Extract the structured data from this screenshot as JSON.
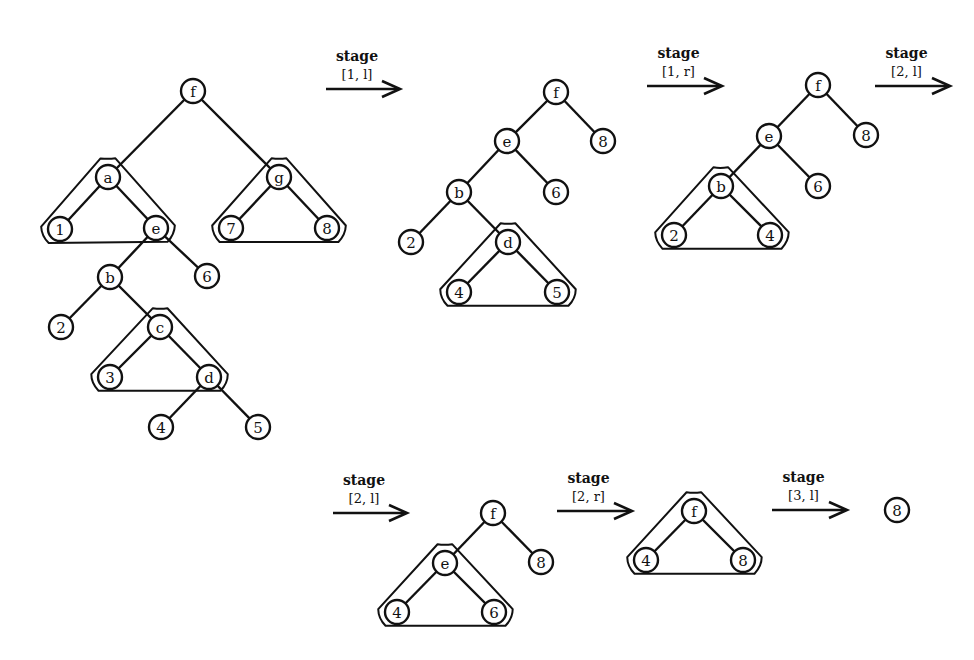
{
  "figure": {
    "node_radius": 12,
    "stroke_color": "#111111",
    "background": "#ffffff"
  },
  "arrows": [
    {
      "id": "a1",
      "word": "stage",
      "index": "[1, l]",
      "x1": 326,
      "x2": 400,
      "y": 89
    },
    {
      "id": "a2",
      "word": "stage",
      "index": "[1, r]",
      "x1": 647,
      "x2": 722,
      "y": 86
    },
    {
      "id": "a3",
      "word": "stage",
      "index": "[2, l]",
      "x1": 875,
      "x2": 950,
      "y": 86
    },
    {
      "id": "a4",
      "word": "stage",
      "index": "[2, l]",
      "x1": 333,
      "x2": 407,
      "y": 513
    },
    {
      "id": "a5",
      "word": "stage",
      "index": "[2, r]",
      "x1": 557,
      "x2": 632,
      "y": 511
    },
    {
      "id": "a6",
      "word": "stage",
      "index": "[3, l]",
      "x1": 772,
      "x2": 847,
      "y": 510
    }
  ],
  "trees": [
    {
      "id": "tree-0",
      "nodes": [
        {
          "label": "f",
          "x": 193,
          "y": 91
        },
        {
          "label": "a",
          "x": 108,
          "y": 177
        },
        {
          "label": "g",
          "x": 279,
          "y": 177
        },
        {
          "label": "1",
          "x": 60,
          "y": 229
        },
        {
          "label": "e",
          "x": 156,
          "y": 228
        },
        {
          "label": "7",
          "x": 231,
          "y": 228
        },
        {
          "label": "8",
          "x": 327,
          "y": 228
        },
        {
          "label": "b",
          "x": 110,
          "y": 277
        },
        {
          "label": "6",
          "x": 207,
          "y": 276
        },
        {
          "label": "2",
          "x": 61,
          "y": 327
        },
        {
          "label": "c",
          "x": 160,
          "y": 327
        },
        {
          "label": "3",
          "x": 110,
          "y": 377
        },
        {
          "label": "d",
          "x": 209,
          "y": 377
        },
        {
          "label": "4",
          "x": 161,
          "y": 427
        },
        {
          "label": "5",
          "x": 258,
          "y": 427
        }
      ],
      "edges": [
        [
          "f",
          "a"
        ],
        [
          "f",
          "g"
        ],
        [
          "a",
          "1"
        ],
        [
          "a",
          "e"
        ],
        [
          "g",
          "7"
        ],
        [
          "g",
          "8"
        ],
        [
          "e",
          "b"
        ],
        [
          "e",
          "6"
        ],
        [
          "b",
          "2"
        ],
        [
          "b",
          "c"
        ],
        [
          "c",
          "3"
        ],
        [
          "c",
          "d"
        ],
        [
          "d",
          "4"
        ],
        [
          "d",
          "5"
        ]
      ],
      "hulls": [
        {
          "top": [
            108,
            177
          ],
          "left": [
            60,
            229
          ],
          "right": [
            156,
            228
          ]
        },
        {
          "top": [
            279,
            177
          ],
          "left": [
            231,
            228
          ],
          "right": [
            327,
            228
          ]
        },
        {
          "top": [
            160,
            327
          ],
          "left": [
            110,
            377
          ],
          "right": [
            209,
            377
          ]
        }
      ]
    },
    {
      "id": "tree-1",
      "nodes": [
        {
          "label": "f",
          "x": 556,
          "y": 92
        },
        {
          "label": "e",
          "x": 507,
          "y": 141
        },
        {
          "label": "8",
          "x": 603,
          "y": 141
        },
        {
          "label": "b",
          "x": 459,
          "y": 192
        },
        {
          "label": "6",
          "x": 556,
          "y": 192
        },
        {
          "label": "2",
          "x": 411,
          "y": 242
        },
        {
          "label": "d",
          "x": 508,
          "y": 242
        },
        {
          "label": "4",
          "x": 459,
          "y": 292
        },
        {
          "label": "5",
          "x": 557,
          "y": 292
        }
      ],
      "edges": [
        [
          "f",
          "e"
        ],
        [
          "f",
          "8"
        ],
        [
          "e",
          "b"
        ],
        [
          "e",
          "6"
        ],
        [
          "b",
          "2"
        ],
        [
          "b",
          "d"
        ],
        [
          "d",
          "4"
        ],
        [
          "d",
          "5"
        ]
      ],
      "hulls": [
        {
          "top": [
            508,
            242
          ],
          "left": [
            459,
            292
          ],
          "right": [
            557,
            292
          ]
        }
      ]
    },
    {
      "id": "tree-2",
      "nodes": [
        {
          "label": "f",
          "x": 818,
          "y": 85
        },
        {
          "label": "e",
          "x": 769,
          "y": 136
        },
        {
          "label": "8",
          "x": 866,
          "y": 135
        },
        {
          "label": "b",
          "x": 721,
          "y": 186
        },
        {
          "label": "6",
          "x": 818,
          "y": 186
        },
        {
          "label": "2",
          "x": 674,
          "y": 235
        },
        {
          "label": "4",
          "x": 770,
          "y": 235
        }
      ],
      "edges": [
        [
          "f",
          "e"
        ],
        [
          "f",
          "8"
        ],
        [
          "e",
          "b"
        ],
        [
          "e",
          "6"
        ],
        [
          "b",
          "2"
        ],
        [
          "b",
          "4"
        ]
      ],
      "hulls": [
        {
          "top": [
            721,
            186
          ],
          "left": [
            674,
            235
          ],
          "right": [
            770,
            235
          ]
        }
      ]
    },
    {
      "id": "tree-3",
      "nodes": [
        {
          "label": "f",
          "x": 493,
          "y": 513
        },
        {
          "label": "e",
          "x": 445,
          "y": 563
        },
        {
          "label": "8",
          "x": 541,
          "y": 562
        },
        {
          "label": "4",
          "x": 397,
          "y": 612
        },
        {
          "label": "6",
          "x": 494,
          "y": 612
        }
      ],
      "edges": [
        [
          "f",
          "e"
        ],
        [
          "f",
          "8"
        ],
        [
          "e",
          "4"
        ],
        [
          "e",
          "6"
        ]
      ],
      "hulls": [
        {
          "top": [
            445,
            563
          ],
          "left": [
            397,
            612
          ],
          "right": [
            494,
            612
          ]
        }
      ]
    },
    {
      "id": "tree-4",
      "nodes": [
        {
          "label": "f",
          "x": 694,
          "y": 511
        },
        {
          "label": "4",
          "x": 646,
          "y": 560
        },
        {
          "label": "8",
          "x": 743,
          "y": 560
        }
      ],
      "edges": [
        [
          "f",
          "4"
        ],
        [
          "f",
          "8"
        ]
      ],
      "hulls": [
        {
          "top": [
            694,
            511
          ],
          "left": [
            646,
            560
          ],
          "right": [
            743,
            560
          ]
        }
      ]
    },
    {
      "id": "tree-5",
      "nodes": [
        {
          "label": "8",
          "x": 897,
          "y": 510
        }
      ],
      "edges": [],
      "hulls": []
    }
  ]
}
